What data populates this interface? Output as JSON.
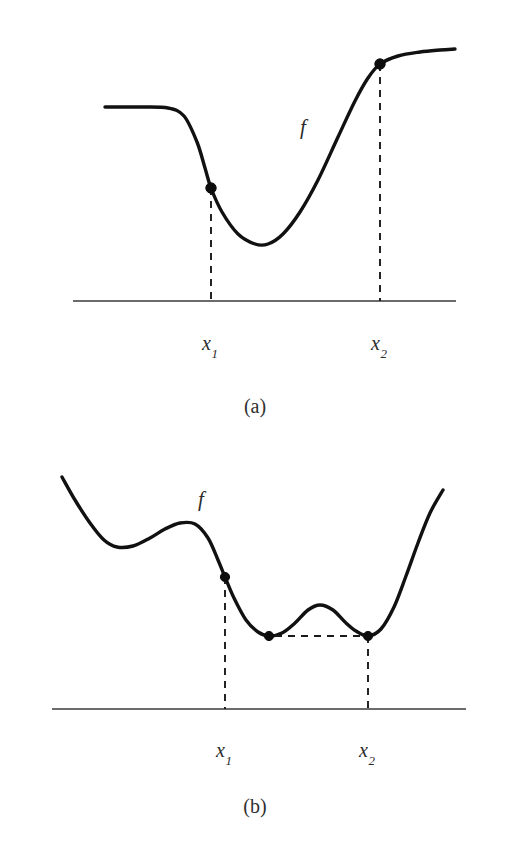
{
  "figure": {
    "background_color": "#ffffff",
    "curve_color": "#111111",
    "axis_color": "#3a3a3a",
    "dash_color": "#1a1a1a",
    "marker_color": "#0d0d0d"
  },
  "panels": [
    {
      "id": "a",
      "caption": "(a)",
      "function_label": "f",
      "x_labels": [
        {
          "base": "x",
          "sub": "1"
        },
        {
          "base": "x",
          "sub": "2"
        }
      ]
    },
    {
      "id": "b",
      "caption": "(b)",
      "function_label": "f",
      "x_labels": [
        {
          "base": "x",
          "sub": "1"
        },
        {
          "base": "x",
          "sub": "2"
        }
      ]
    }
  ],
  "chart_data": [
    {
      "type": "line",
      "panel": "a",
      "title": "(a)",
      "xlabel": "",
      "ylabel": "",
      "grid": false,
      "legend": null,
      "annotations": [
        {
          "text": "f",
          "x": 305,
          "y": 128
        },
        {
          "text": "x1",
          "x": 211,
          "y": 345
        },
        {
          "text": "x2",
          "x": 380,
          "y": 345
        }
      ],
      "axis_line": {
        "x_start": 73,
        "x_end": 456,
        "y": 301
      },
      "description": "Curve enters flat on the left, descends through the point at x1, reaches a minimum, rises steeply through the point at x2, then flattens out at a higher level on the right.",
      "curve_points": [
        [
          105,
          107
        ],
        [
          140,
          107
        ],
        [
          168,
          108
        ],
        [
          184,
          116
        ],
        [
          197,
          142
        ],
        [
          205,
          168
        ],
        [
          211,
          188
        ],
        [
          222,
          212
        ],
        [
          238,
          234
        ],
        [
          255,
          244
        ],
        [
          268,
          244
        ],
        [
          283,
          234
        ],
        [
          300,
          212
        ],
        [
          318,
          180
        ],
        [
          338,
          137
        ],
        [
          355,
          101
        ],
        [
          368,
          78
        ],
        [
          380,
          64
        ],
        [
          398,
          56
        ],
        [
          420,
          52
        ],
        [
          440,
          50
        ],
        [
          455,
          49
        ]
      ],
      "markers": [
        {
          "label": "x1",
          "x": 211,
          "y": 188
        },
        {
          "label": "x2",
          "x": 380,
          "y": 64
        }
      ],
      "leaders": [
        {
          "type": "vertical",
          "x": 211,
          "y_top": 188,
          "y_bottom": 301
        },
        {
          "type": "vertical",
          "x": 380,
          "y_top": 64,
          "y_bottom": 301
        }
      ]
    },
    {
      "type": "line",
      "panel": "b",
      "title": "(b)",
      "xlabel": "",
      "ylabel": "",
      "grid": false,
      "legend": null,
      "annotations": [
        {
          "text": "f",
          "x": 203,
          "y": 500
        },
        {
          "text": "x1",
          "x": 225,
          "y": 752
        },
        {
          "text": "x2",
          "x": 368,
          "y": 752
        }
      ],
      "axis_line": {
        "x_start": 52,
        "x_end": 466,
        "y": 709
      },
      "description": "Curve descends from upper-left into a shallow local minimum, rises to a local maximum near the f label, descends through the point at x1 into a local minimum, rises to an interior local maximum, descends to a second local minimum at x2 of equal height, then rises steeply on the right. A horizontal dashed segment connects the two equal-height minima.",
      "curve_points": [
        [
          62,
          477
        ],
        [
          75,
          500
        ],
        [
          90,
          523
        ],
        [
          104,
          540
        ],
        [
          117,
          547
        ],
        [
          133,
          546
        ],
        [
          150,
          538
        ],
        [
          165,
          529
        ],
        [
          180,
          523
        ],
        [
          195,
          524
        ],
        [
          208,
          538
        ],
        [
          218,
          560
        ],
        [
          225,
          577
        ],
        [
          234,
          598
        ],
        [
          246,
          620
        ],
        [
          258,
          632
        ],
        [
          269,
          636
        ],
        [
          282,
          633
        ],
        [
          295,
          623
        ],
        [
          308,
          610
        ],
        [
          320,
          605
        ],
        [
          333,
          610
        ],
        [
          345,
          622
        ],
        [
          356,
          631
        ],
        [
          368,
          636
        ],
        [
          381,
          629
        ],
        [
          394,
          607
        ],
        [
          406,
          576
        ],
        [
          418,
          543
        ],
        [
          430,
          513
        ],
        [
          443,
          490
        ]
      ],
      "markers": [
        {
          "label": "x1",
          "x": 225,
          "y": 577
        },
        {
          "label": "min-left",
          "x": 269,
          "y": 636
        },
        {
          "label": "x2",
          "x": 368,
          "y": 636
        }
      ],
      "leaders": [
        {
          "type": "vertical",
          "x": 225,
          "y_top": 577,
          "y_bottom": 709
        },
        {
          "type": "vertical",
          "x": 368,
          "y_top": 636,
          "y_bottom": 709
        },
        {
          "type": "horizontal",
          "y": 636,
          "x_start": 275,
          "x_end": 362
        }
      ]
    }
  ]
}
